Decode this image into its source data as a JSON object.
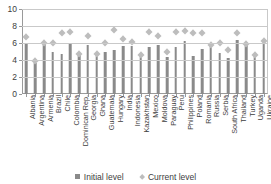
{
  "chart_data": {
    "type": "bar",
    "title": "",
    "xlabel": "",
    "ylabel": "",
    "ylim": [
      0,
      10
    ],
    "yticks": [
      0,
      2,
      4,
      6,
      8,
      10
    ],
    "grid": true,
    "legend_position": "bottom",
    "categories": [
      "Albania",
      "Argentina",
      "Armenia",
      "Brazil",
      "Chile",
      "Colombia",
      "Dominican Rep.",
      "Georgia",
      "Ghana",
      "Guatemala",
      "Hungary",
      "India",
      "Indonesia",
      "Kazakhstan",
      "Mexico",
      "Moldova",
      "Paraguay",
      "Peru",
      "Philippines",
      "Poland",
      "Romania",
      "Russia",
      "Serbia",
      "South Africa",
      "Thailand",
      "Turkey",
      "Uganda",
      "Ukraine"
    ],
    "series": [
      {
        "name": "Initial level",
        "marker": "square",
        "color": "#8a8a8a",
        "values": [
          6.0,
          3.6,
          5.9,
          5.0,
          4.7,
          5.9,
          4.6,
          5.8,
          4.6,
          5.0,
          5.2,
          5.6,
          5.6,
          4.5,
          5.5,
          5.8,
          4.3,
          5.5,
          6.2,
          4.5,
          5.3,
          5.8,
          4.8,
          4.2,
          6.3,
          5.8,
          4.5,
          6.3
        ]
      },
      {
        "name": "Current level",
        "marker": "diamond",
        "color": "#bdbdbd",
        "values": [
          6.8,
          3.9,
          6.0,
          6.0,
          7.2,
          7.4,
          4.8,
          6.9,
          4.8,
          6.1,
          7.6,
          6.5,
          6.2,
          4.6,
          7.3,
          6.9,
          5.0,
          7.3,
          7.5,
          7.2,
          7.2,
          5.8,
          6.0,
          5.2,
          7.2,
          5.9,
          4.6,
          6.3
        ]
      }
    ]
  },
  "legend": {
    "items": [
      {
        "label": "Initial level",
        "marker": "square"
      },
      {
        "label": "Current level",
        "marker": "diamond"
      }
    ]
  }
}
